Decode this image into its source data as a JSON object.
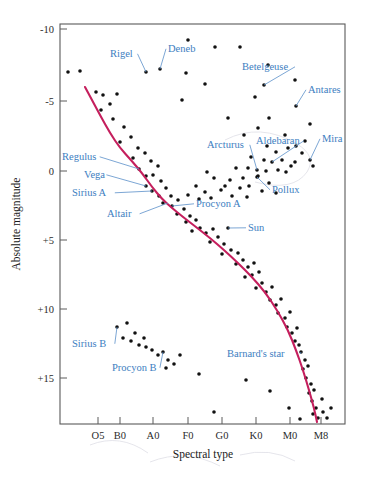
{
  "figure": {
    "domain_label": "hertzsprung-russell-diagram",
    "background_color": "#ffffff",
    "curve_color": "#c51f5d",
    "label_color": "#3d7ebf",
    "dot_color": "#111111",
    "frame_color": "#5a5a5a"
  },
  "chart_data": {
    "type": "scatter",
    "title": "",
    "xlabel": "Spectral type",
    "ylabel": "Absolute magnitude",
    "grid": false,
    "legend": null,
    "x_tick_labels": [
      "O5",
      "B0",
      "A0",
      "F0",
      "G0",
      "K0",
      "M0",
      "M8"
    ],
    "x_tick_positions": [
      98,
      120,
      153,
      188,
      222,
      256,
      290,
      321
    ],
    "y_tick_labels": [
      "-10",
      "-5",
      "0",
      "+5",
      "+10",
      "+15"
    ],
    "y_tick_values": [
      -10,
      -5,
      0,
      5,
      10,
      15
    ],
    "y_tick_positions": [
      29,
      101,
      171,
      240,
      309,
      378
    ],
    "ylim": [
      -11.5,
      18.5
    ],
    "y_axis_inverted": true,
    "plot_box": {
      "left": 60,
      "top": 24,
      "right": 345,
      "bottom": 424
    },
    "annotations": [
      {
        "name": "Rigel",
        "label_x": 110,
        "label_y": 57,
        "point_x": 146,
        "point_y": 72,
        "leader": true
      },
      {
        "name": "Deneb",
        "label_x": 168,
        "label_y": 52,
        "point_x": 160,
        "point_y": 69,
        "leader": true
      },
      {
        "name": "Betelgeuse",
        "label_x": 242,
        "label_y": 70,
        "point_x": 264,
        "point_y": 85,
        "leader": true
      },
      {
        "name": "Antares",
        "label_x": 308,
        "label_y": 93,
        "point_x": 296,
        "point_y": 106,
        "leader": true
      },
      {
        "name": "Arcturus",
        "label_x": 207,
        "label_y": 148,
        "point_x": 257,
        "point_y": 170,
        "leader": true
      },
      {
        "name": "Aldebaran",
        "label_x": 256,
        "label_y": 144,
        "point_x": 272,
        "point_y": 162,
        "leader": true
      },
      {
        "name": "Mira",
        "label_x": 322,
        "label_y": 142,
        "point_x": 310,
        "point_y": 160,
        "leader": true
      },
      {
        "name": "Pollux",
        "label_x": 272,
        "label_y": 193,
        "point_x": 257,
        "point_y": 177,
        "leader": true
      },
      {
        "name": "Regulus",
        "label_x": 62,
        "label_y": 160,
        "point_x": 139,
        "point_y": 169,
        "leader": true
      },
      {
        "name": "Vega",
        "label_x": 84,
        "label_y": 178,
        "point_x": 146,
        "point_y": 186,
        "leader": true
      },
      {
        "name": "Sirius A",
        "label_x": 72,
        "label_y": 196,
        "point_x": 152,
        "point_y": 191,
        "leader": true
      },
      {
        "name": "Altair",
        "label_x": 107,
        "label_y": 217,
        "point_x": 168,
        "point_y": 203,
        "leader": true
      },
      {
        "name": "Procyon A",
        "label_x": 196,
        "label_y": 207,
        "point_x": 172,
        "point_y": 206,
        "leader": true
      },
      {
        "name": "Sun",
        "label_x": 248,
        "label_y": 231,
        "point_x": 228,
        "point_y": 228,
        "leader": true
      },
      {
        "name": "Sirius B",
        "label_x": 72,
        "label_y": 347,
        "point_x": 117,
        "point_y": 327,
        "leader": true
      },
      {
        "name": "Procyon B",
        "label_x": 112,
        "label_y": 371,
        "point_x": 163,
        "point_y": 352,
        "leader": true
      },
      {
        "name": "Barnard's star",
        "label_x": 227,
        "label_y": 357,
        "point_x": 301,
        "point_y": 352,
        "leader": true
      }
    ],
    "main_sequence_curve": [
      [
        85,
        87
      ],
      [
        92,
        100
      ],
      [
        100,
        115
      ],
      [
        110,
        133
      ],
      [
        120,
        148
      ],
      [
        131,
        160
      ],
      [
        142,
        173
      ],
      [
        152,
        187
      ],
      [
        162,
        199
      ],
      [
        172,
        208
      ],
      [
        183,
        217
      ],
      [
        196,
        227
      ],
      [
        210,
        238
      ],
      [
        224,
        250
      ],
      [
        238,
        263
      ],
      [
        252,
        277
      ],
      [
        265,
        292
      ],
      [
        277,
        310
      ],
      [
        288,
        330
      ],
      [
        296,
        350
      ],
      [
        303,
        370
      ],
      [
        309,
        390
      ],
      [
        314,
        408
      ],
      [
        317,
        422
      ]
    ],
    "stars": [
      [
        68,
        72
      ],
      [
        80,
        71
      ],
      [
        146,
        72
      ],
      [
        160,
        69
      ],
      [
        186,
        73
      ],
      [
        188,
        40
      ],
      [
        215,
        47
      ],
      [
        240,
        47
      ],
      [
        268,
        65
      ],
      [
        205,
        84
      ],
      [
        264,
        85
      ],
      [
        295,
        80
      ],
      [
        182,
        100
      ],
      [
        255,
        97
      ],
      [
        296,
        106
      ],
      [
        269,
        118
      ],
      [
        228,
        118
      ],
      [
        258,
        128
      ],
      [
        310,
        124
      ],
      [
        244,
        135
      ],
      [
        285,
        135
      ],
      [
        305,
        141
      ],
      [
        267,
        146
      ],
      [
        288,
        148
      ],
      [
        296,
        146
      ],
      [
        276,
        152
      ],
      [
        302,
        153
      ],
      [
        257,
        170
      ],
      [
        272,
        162
      ],
      [
        310,
        160
      ],
      [
        282,
        160
      ],
      [
        291,
        166
      ],
      [
        264,
        160
      ],
      [
        251,
        157
      ],
      [
        313,
        166
      ],
      [
        266,
        171
      ],
      [
        278,
        170
      ],
      [
        258,
        176
      ],
      [
        248,
        168
      ],
      [
        236,
        168
      ],
      [
        295,
        162
      ],
      [
        286,
        172
      ],
      [
        243,
        178
      ],
      [
        230,
        180
      ],
      [
        257,
        177
      ],
      [
        269,
        183
      ],
      [
        240,
        188
      ],
      [
        225,
        186
      ],
      [
        249,
        186
      ],
      [
        262,
        191
      ],
      [
        276,
        193
      ],
      [
        207,
        172
      ],
      [
        214,
        178
      ],
      [
        221,
        190
      ],
      [
        232,
        196
      ],
      [
        205,
        192
      ],
      [
        196,
        186
      ],
      [
        199,
        199
      ],
      [
        188,
        195
      ],
      [
        211,
        198
      ],
      [
        247,
        197
      ],
      [
        96,
        92
      ],
      [
        103,
        95
      ],
      [
        110,
        104
      ],
      [
        117,
        94
      ],
      [
        101,
        110
      ],
      [
        113,
        119
      ],
      [
        124,
        127
      ],
      [
        131,
        137
      ],
      [
        120,
        142
      ],
      [
        138,
        148
      ],
      [
        145,
        153
      ],
      [
        133,
        158
      ],
      [
        151,
        161
      ],
      [
        139,
        169
      ],
      [
        158,
        166
      ],
      [
        146,
        176
      ],
      [
        153,
        175
      ],
      [
        161,
        181
      ],
      [
        146,
        186
      ],
      [
        152,
        191
      ],
      [
        166,
        188
      ],
      [
        159,
        196
      ],
      [
        171,
        196
      ],
      [
        163,
        203
      ],
      [
        172,
        206
      ],
      [
        178,
        200
      ],
      [
        184,
        209
      ],
      [
        177,
        214
      ],
      [
        190,
        216
      ],
      [
        186,
        222
      ],
      [
        196,
        220
      ],
      [
        200,
        228
      ],
      [
        192,
        231
      ],
      [
        206,
        233
      ],
      [
        213,
        229
      ],
      [
        218,
        237
      ],
      [
        210,
        242
      ],
      [
        224,
        244
      ],
      [
        228,
        228
      ],
      [
        231,
        250
      ],
      [
        222,
        254
      ],
      [
        238,
        253
      ],
      [
        243,
        260
      ],
      [
        236,
        264
      ],
      [
        248,
        267
      ],
      [
        254,
        263
      ],
      [
        252,
        275
      ],
      [
        259,
        272
      ],
      [
        245,
        277
      ],
      [
        262,
        283
      ],
      [
        256,
        288
      ],
      [
        266,
        292
      ],
      [
        272,
        287
      ],
      [
        270,
        300
      ],
      [
        276,
        305
      ],
      [
        281,
        299
      ],
      [
        278,
        313
      ],
      [
        285,
        318
      ],
      [
        290,
        312
      ],
      [
        287,
        327
      ],
      [
        292,
        333
      ],
      [
        297,
        328
      ],
      [
        295,
        341
      ],
      [
        301,
        352
      ],
      [
        299,
        345
      ],
      [
        305,
        360
      ],
      [
        303,
        369
      ],
      [
        308,
        366
      ],
      [
        306,
        378
      ],
      [
        311,
        384
      ],
      [
        309,
        393
      ],
      [
        314,
        390
      ],
      [
        312,
        401
      ],
      [
        316,
        408
      ],
      [
        313,
        414
      ],
      [
        318,
        418
      ],
      [
        322,
        399
      ],
      [
        323,
        412
      ],
      [
        117,
        327
      ],
      [
        127,
        323
      ],
      [
        135,
        333
      ],
      [
        123,
        338
      ],
      [
        131,
        341
      ],
      [
        139,
        345
      ],
      [
        146,
        347
      ],
      [
        152,
        350
      ],
      [
        144,
        338
      ],
      [
        158,
        355
      ],
      [
        163,
        352
      ],
      [
        168,
        360
      ],
      [
        174,
        364
      ],
      [
        180,
        355
      ],
      [
        166,
        368
      ],
      [
        199,
        374
      ],
      [
        246,
        380
      ],
      [
        270,
        391
      ],
      [
        214,
        412
      ],
      [
        289,
        408
      ],
      [
        300,
        419
      ],
      [
        331,
        408
      ],
      [
        327,
        418
      ]
    ]
  },
  "axes": {
    "y_title": "Absolute magnitude",
    "x_title": "Spectral type"
  }
}
